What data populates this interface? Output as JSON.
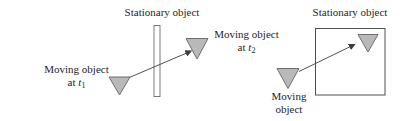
{
  "figure": {
    "left_panel": {
      "stationary_label": "Stationary object",
      "moving_t1": {
        "line1": "Moving object",
        "at": "at",
        "t_symbol": "t",
        "subscript": "1"
      },
      "moving_t2": {
        "line1": "Moving object",
        "at": "at",
        "t_symbol": "t",
        "subscript": "2"
      }
    },
    "right_panel": {
      "stationary_label": "Stationary object",
      "moving": {
        "line1": "Moving",
        "line2": "object"
      }
    },
    "colors": {
      "background": "#ffffff",
      "text": "#1e1e1e",
      "triangle_fill": "#b9b9b9",
      "triangle_stroke": "#6f6f6f",
      "arrow_line": "#3d3d3d",
      "barrier_stroke": "#7a7a7a",
      "box_stroke": "#4f4f4f"
    }
  }
}
